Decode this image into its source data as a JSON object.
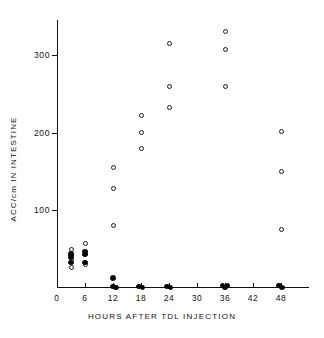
{
  "chart_data": {
    "type": "scatter",
    "title": "",
    "xlabel": "HOURS AFTER TDL INJECTION",
    "ylabel": "ACC/cm IN INTESTINE",
    "xlim": [
      0,
      54
    ],
    "ylim": [
      0,
      345
    ],
    "grid": false,
    "legend_position": "none",
    "xticks": [
      0,
      6,
      12,
      18,
      24,
      30,
      36,
      42,
      48
    ],
    "xtick_labels": [
      "0",
      "6",
      "12",
      "18",
      "24",
      "30",
      "36",
      "42",
      "48"
    ],
    "yticks": [
      100,
      200,
      300
    ],
    "ytick_labels": [
      "100",
      "200",
      "300"
    ],
    "series": [
      {
        "name": "open-circle",
        "marker": "open circle",
        "points": [
          {
            "x": 3,
            "y": 50
          },
          {
            "x": 3,
            "y": 37
          },
          {
            "x": 3,
            "y": 27
          },
          {
            "x": 6,
            "y": 57
          },
          {
            "x": 6,
            "y": 45
          },
          {
            "x": 6,
            "y": 30
          },
          {
            "x": 12,
            "y": 155
          },
          {
            "x": 12,
            "y": 128
          },
          {
            "x": 12,
            "y": 80
          },
          {
            "x": 18,
            "y": 222
          },
          {
            "x": 18,
            "y": 200
          },
          {
            "x": 18,
            "y": 180
          },
          {
            "x": 24,
            "y": 315
          },
          {
            "x": 24,
            "y": 260
          },
          {
            "x": 24,
            "y": 232
          },
          {
            "x": 36,
            "y": 330
          },
          {
            "x": 36,
            "y": 307
          },
          {
            "x": 36,
            "y": 260
          },
          {
            "x": 48,
            "y": 202
          },
          {
            "x": 48,
            "y": 150
          },
          {
            "x": 48,
            "y": 75
          }
        ]
      },
      {
        "name": "filled-circle",
        "marker": "filled circle",
        "points": [
          {
            "x": 3,
            "y": 44
          },
          {
            "x": 3,
            "y": 40
          },
          {
            "x": 3,
            "y": 33
          },
          {
            "x": 6,
            "y": 47
          },
          {
            "x": 6,
            "y": 43
          },
          {
            "x": 6,
            "y": 33
          },
          {
            "x": 12,
            "y": 13
          },
          {
            "x": 12,
            "y": 2
          },
          {
            "x": 12.6,
            "y": 1
          },
          {
            "x": 17.6,
            "y": 2
          },
          {
            "x": 18.3,
            "y": 1
          },
          {
            "x": 23.6,
            "y": 2
          },
          {
            "x": 24.3,
            "y": 1
          },
          {
            "x": 35.4,
            "y": 3
          },
          {
            "x": 36.0,
            "y": 1
          },
          {
            "x": 36.5,
            "y": 3
          },
          {
            "x": 47.6,
            "y": 3
          },
          {
            "x": 48.2,
            "y": 1
          }
        ]
      }
    ]
  }
}
